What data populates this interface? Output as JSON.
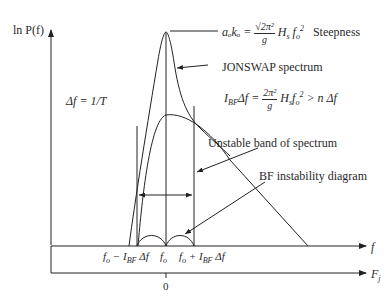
{
  "diagram": {
    "y_axis_label": "ln P(f)",
    "x_axis_label": "f",
    "x2_axis_label": "F_j",
    "x2_origin_tick": "0",
    "delta_f_label": "Δf = 1/T",
    "steepness": {
      "lhs": "aₒkₒ =",
      "numerator": "√2π²",
      "denominator": "g",
      "rhs": "H_s f_o²",
      "tag": "Steepness"
    },
    "jonswap_label": "JONSWAP spectrum",
    "bfi_formula": {
      "lhs": "I_BF Δf =",
      "numerator": "2π²",
      "denominator": "g",
      "rhs": "H_s f_o² > n Δf"
    },
    "unstable_band_label": "Unstable band of spectrum",
    "bf_diagram_label": "BF instability diagram",
    "x_ticks": {
      "left": "fₒ − I_BF Δf",
      "center": "fₒ",
      "right": "fₒ + I_BF Δf"
    }
  }
}
